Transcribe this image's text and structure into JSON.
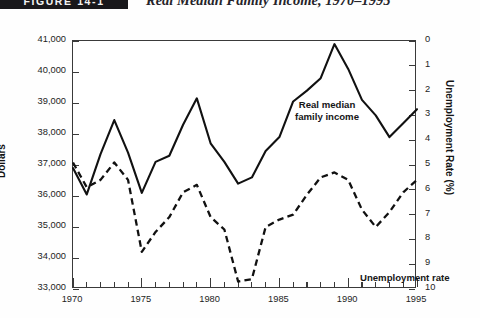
{
  "figure": {
    "tag": "FIGURE 14-1",
    "title": "Real Median Family Income, 1970–1995"
  },
  "axes": {
    "left_title": "Dollars",
    "right_title": "Unemployment Rate (%)",
    "left_ticks": [
      "41,000",
      "40,000",
      "39,000",
      "38,000",
      "37,000",
      "36,000",
      "35,000",
      "34,000",
      "33,000"
    ],
    "right_ticks": [
      "0",
      "1",
      "2",
      "3",
      "4",
      "5",
      "6",
      "7",
      "8",
      "9",
      "10"
    ],
    "x_ticks": [
      "1970",
      "1975",
      "1980",
      "1985",
      "1990",
      "1995"
    ]
  },
  "annotations": {
    "income_line1": "Real median",
    "income_line2": "family income",
    "unemployment": "Unemployment rate"
  },
  "colors": {
    "axis": "#3a3a3a",
    "income_line": "#111111",
    "unemployment_line": "#111111",
    "tag_background": "#19181b",
    "tag_text": "#f2f2f2"
  },
  "chart_data": {
    "type": "line",
    "title": "Real Median Family Income, 1970–1995",
    "xlabel": "",
    "ylabel": "Dollars",
    "y2label": "Unemployment Rate (%)",
    "grid": false,
    "legend": "in-plot annotations",
    "xlim": [
      1970,
      1995
    ],
    "ylim": [
      33000,
      41000
    ],
    "y2lim": [
      10,
      0
    ],
    "x": [
      1970,
      1971,
      1972,
      1973,
      1974,
      1975,
      1976,
      1977,
      1978,
      1979,
      1980,
      1981,
      1982,
      1983,
      1984,
      1985,
      1986,
      1987,
      1988,
      1989,
      1990,
      1991,
      1992,
      1993,
      1994,
      1995
    ],
    "series": [
      {
        "name": "Real median family income",
        "axis": "left",
        "style": "solid",
        "unit": "dollars",
        "values": [
          36900,
          36050,
          37350,
          38450,
          37400,
          36100,
          37100,
          37300,
          38300,
          39150,
          37700,
          37100,
          36400,
          36600,
          37450,
          37900,
          39050,
          39400,
          39800,
          40900,
          40100,
          39100,
          38600,
          37900,
          38350,
          38800
        ]
      },
      {
        "name": "Unemployment rate",
        "axis": "right",
        "style": "dashed",
        "unit": "percent",
        "values": [
          4.9,
          5.9,
          5.6,
          4.9,
          5.6,
          8.5,
          7.7,
          7.1,
          6.1,
          5.8,
          7.1,
          7.6,
          9.7,
          9.6,
          7.5,
          7.2,
          7.0,
          6.2,
          5.5,
          5.3,
          5.6,
          6.8,
          7.5,
          6.9,
          6.1,
          5.6
        ]
      }
    ]
  }
}
